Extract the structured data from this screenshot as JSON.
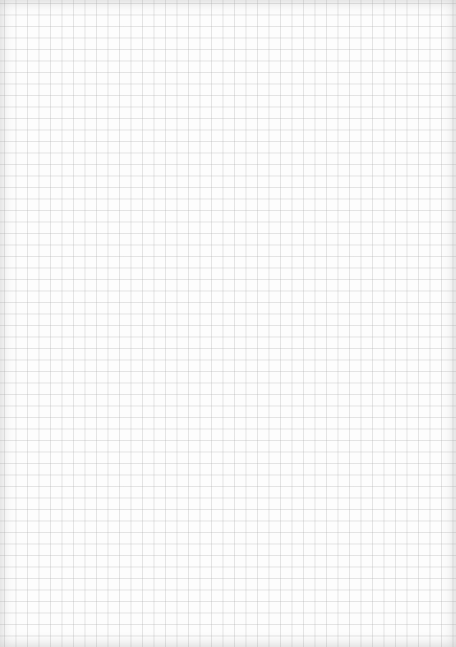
{
  "sheet": {
    "type": "grid-paper",
    "grid_color": "#b4b4b4",
    "background_color": "#fdfdfd"
  }
}
